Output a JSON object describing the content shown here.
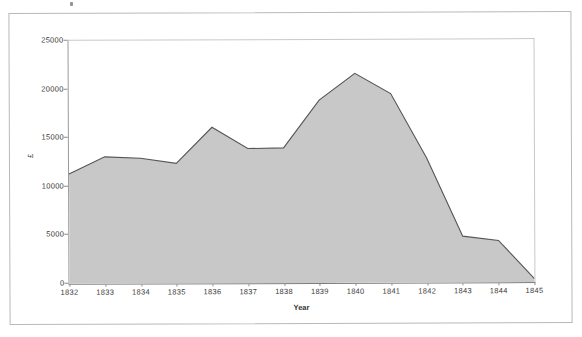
{
  "chart_data": {
    "type": "area",
    "title": "",
    "xlabel": "Year",
    "ylabel": "£",
    "x": [
      1832,
      1833,
      1834,
      1835,
      1836,
      1837,
      1838,
      1839,
      1840,
      1841,
      1842,
      1843,
      1844,
      1845
    ],
    "categories": [
      "1832",
      "1833",
      "1834",
      "1835",
      "1836",
      "1837",
      "1838",
      "1839",
      "1840",
      "1841",
      "1842",
      "1843",
      "1844",
      "1845"
    ],
    "values": [
      11300,
      13050,
      12900,
      12350,
      16050,
      13850,
      13900,
      18800,
      21550,
      19450,
      12800,
      4750,
      4300,
      350
    ],
    "series": [
      {
        "name": "£",
        "values": [
          11300,
          13050,
          12900,
          12350,
          16050,
          13850,
          13900,
          18800,
          21550,
          19450,
          12800,
          4750,
          4300,
          350
        ]
      }
    ],
    "ylim": [
      0,
      25000
    ],
    "yticks": [
      0,
      5000,
      10000,
      15000,
      20000,
      25000
    ],
    "yticklabels": [
      "0",
      "5000",
      "10000",
      "15000",
      "20000",
      "25000"
    ],
    "xlim": [
      1832,
      1845
    ],
    "grid": false,
    "legend": false,
    "legend_position": "none",
    "area_fill_color": "#c8c8c8",
    "line_color": "#555555",
    "axis_color": "#8a8a8a",
    "plot_background": "#ffffff",
    "frame_border_color": "#b9b9b9"
  },
  "figure": {
    "background": "#ffffff",
    "page_speck": ""
  }
}
